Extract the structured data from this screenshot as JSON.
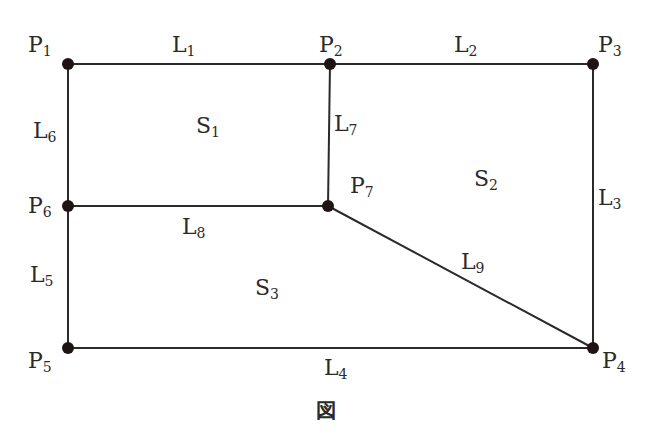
{
  "diagram": {
    "caption": "図",
    "colors": {
      "line": "#2a2a2a",
      "point": "#1e1414",
      "text": "#2a2a2a",
      "background": "#ffffff"
    },
    "points": [
      {
        "id": "P1",
        "base": "P",
        "sub": "1",
        "x": 68,
        "y": 64,
        "lx": 28,
        "ly": 52
      },
      {
        "id": "P2",
        "base": "P",
        "sub": "2",
        "x": 330,
        "y": 64,
        "lx": 319,
        "ly": 52
      },
      {
        "id": "P3",
        "base": "P",
        "sub": "3",
        "x": 593,
        "y": 64,
        "lx": 598,
        "ly": 52
      },
      {
        "id": "P4",
        "base": "P",
        "sub": "4",
        "x": 593,
        "y": 348,
        "lx": 602,
        "ly": 368
      },
      {
        "id": "P5",
        "base": "P",
        "sub": "5",
        "x": 68,
        "y": 348,
        "lx": 28,
        "ly": 368
      },
      {
        "id": "P6",
        "base": "P",
        "sub": "6",
        "x": 68,
        "y": 206,
        "lx": 28,
        "ly": 213
      },
      {
        "id": "P7",
        "base": "P",
        "sub": "7",
        "x": 328,
        "y": 206,
        "lx": 350,
        "ly": 193
      }
    ],
    "lines": [
      {
        "id": "L1",
        "base": "L",
        "sub": "1",
        "from": "P1",
        "to": "P2",
        "lx": 172,
        "ly": 52
      },
      {
        "id": "L2",
        "base": "L",
        "sub": "2",
        "from": "P2",
        "to": "P3",
        "lx": 454,
        "ly": 52
      },
      {
        "id": "L3",
        "base": "L",
        "sub": "3",
        "from": "P3",
        "to": "P4",
        "lx": 598,
        "ly": 205
      },
      {
        "id": "L4",
        "base": "L",
        "sub": "4",
        "from": "P5",
        "to": "P4",
        "lx": 324,
        "ly": 375
      },
      {
        "id": "L5",
        "base": "L",
        "sub": "5",
        "from": "P6",
        "to": "P5",
        "lx": 30,
        "ly": 282
      },
      {
        "id": "L6",
        "base": "L",
        "sub": "6",
        "from": "P1",
        "to": "P6",
        "lx": 33,
        "ly": 138
      },
      {
        "id": "L7",
        "base": "L",
        "sub": "7",
        "from": "P2",
        "to": "P7",
        "lx": 334,
        "ly": 131
      },
      {
        "id": "L8",
        "base": "L",
        "sub": "8",
        "from": "P6",
        "to": "P7",
        "lx": 182,
        "ly": 234
      },
      {
        "id": "L9",
        "base": "L",
        "sub": "9",
        "from": "P7",
        "to": "P4",
        "lx": 461,
        "ly": 269
      }
    ],
    "regions": [
      {
        "id": "S1",
        "base": "S",
        "sub": "1",
        "lx": 196,
        "ly": 133
      },
      {
        "id": "S2",
        "base": "S",
        "sub": "2",
        "lx": 474,
        "ly": 186
      },
      {
        "id": "S3",
        "base": "S",
        "sub": "3",
        "lx": 255,
        "ly": 295
      }
    ]
  }
}
